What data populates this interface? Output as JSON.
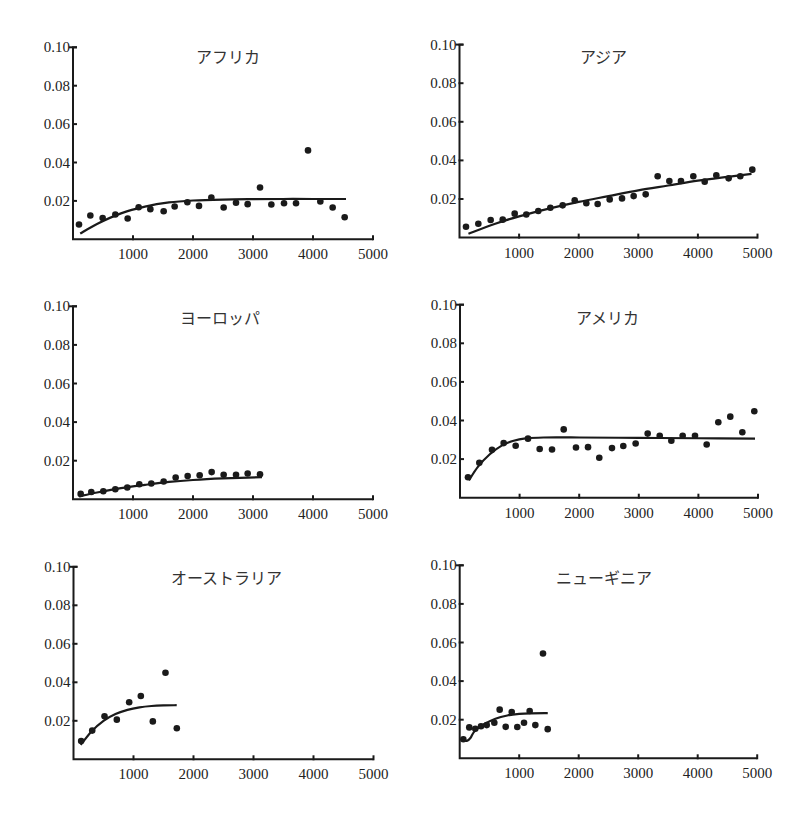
{
  "chart_data": [
    {
      "type": "scatter",
      "title": "アフリカ",
      "xlabel": "",
      "ylabel": "",
      "xlim": [
        0,
        5000
      ],
      "ylim": [
        0,
        0.1
      ],
      "xticks": [
        "1000",
        "2000",
        "3000",
        "4000",
        "5000"
      ],
      "yticks": [
        "0.02",
        "0.04",
        "0.06",
        "0.08",
        "0.10"
      ],
      "grid": false,
      "points": [
        [
          100,
          0.0077
        ],
        [
          289,
          0.0124
        ],
        [
          494,
          0.0111
        ],
        [
          706,
          0.0129
        ],
        [
          911,
          0.0108
        ],
        [
          1094,
          0.0167
        ],
        [
          1289,
          0.0157
        ],
        [
          1511,
          0.0146
        ],
        [
          1694,
          0.0171
        ],
        [
          1906,
          0.0193
        ],
        [
          2100,
          0.0174
        ],
        [
          2306,
          0.0218
        ],
        [
          2511,
          0.0166
        ],
        [
          2717,
          0.019
        ],
        [
          2911,
          0.0183
        ],
        [
          3117,
          0.027
        ],
        [
          3306,
          0.0181
        ],
        [
          3517,
          0.0188
        ],
        [
          3717,
          0.0188
        ],
        [
          3917,
          0.0463
        ],
        [
          4122,
          0.0197
        ],
        [
          4328,
          0.0166
        ],
        [
          4528,
          0.0115
        ]
      ],
      "fit": [
        [
          120,
          0.003
        ],
        [
          400,
          0.008
        ],
        [
          800,
          0.0135
        ],
        [
          1200,
          0.017
        ],
        [
          1600,
          0.0192
        ],
        [
          2000,
          0.0202
        ],
        [
          2500,
          0.0207
        ],
        [
          3000,
          0.0209
        ],
        [
          3500,
          0.021
        ],
        [
          4000,
          0.021
        ],
        [
          4550,
          0.021
        ]
      ]
    },
    {
      "type": "scatter",
      "title": "アジア",
      "xlabel": "",
      "ylabel": "",
      "xlim": [
        0,
        5000
      ],
      "ylim": [
        0,
        0.1
      ],
      "xticks": [
        "1000",
        "2000",
        "3000",
        "4000",
        "5000"
      ],
      "yticks": [
        "0.02",
        "0.04",
        "0.06",
        "0.08",
        "0.10"
      ],
      "grid": false,
      "points": [
        [
          109,
          0.0056
        ],
        [
          316,
          0.0072
        ],
        [
          523,
          0.0091
        ],
        [
          725,
          0.0093
        ],
        [
          926,
          0.0124
        ],
        [
          1121,
          0.012
        ],
        [
          1322,
          0.0138
        ],
        [
          1524,
          0.0155
        ],
        [
          1731,
          0.0167
        ],
        [
          1933,
          0.0193
        ],
        [
          2128,
          0.0178
        ],
        [
          2318,
          0.0174
        ],
        [
          2520,
          0.0198
        ],
        [
          2727,
          0.0203
        ],
        [
          2922,
          0.0215
        ],
        [
          3124,
          0.0224
        ],
        [
          3325,
          0.0318
        ],
        [
          3521,
          0.0293
        ],
        [
          3716,
          0.0293
        ],
        [
          3923,
          0.0318
        ],
        [
          4114,
          0.029
        ],
        [
          4309,
          0.0323
        ],
        [
          4516,
          0.0307
        ],
        [
          4711,
          0.0318
        ],
        [
          4913,
          0.0352
        ]
      ],
      "fit": [
        [
          150,
          0.002
        ],
        [
          600,
          0.0072
        ],
        [
          1000,
          0.011
        ],
        [
          1500,
          0.015
        ],
        [
          2000,
          0.0185
        ],
        [
          2500,
          0.0215
        ],
        [
          3000,
          0.0245
        ],
        [
          3500,
          0.027
        ],
        [
          4000,
          0.0295
        ],
        [
          4500,
          0.0315
        ],
        [
          4900,
          0.033
        ]
      ]
    },
    {
      "type": "scatter",
      "title": "ヨーロッパ",
      "xlabel": "",
      "ylabel": "",
      "xlim": [
        0,
        5000
      ],
      "ylim": [
        0,
        0.1
      ],
      "xticks": [
        "1000",
        "2000",
        "3000",
        "4000",
        "5000"
      ],
      "yticks": [
        "0.02",
        "0.04",
        "0.06",
        "0.08",
        "0.10"
      ],
      "grid": false,
      "points": [
        [
          128,
          0.0028
        ],
        [
          305,
          0.0038
        ],
        [
          505,
          0.0042
        ],
        [
          705,
          0.0052
        ],
        [
          905,
          0.0061
        ],
        [
          1105,
          0.0078
        ],
        [
          1305,
          0.0082
        ],
        [
          1511,
          0.0092
        ],
        [
          1711,
          0.0113
        ],
        [
          1911,
          0.0121
        ],
        [
          2111,
          0.0125
        ],
        [
          2311,
          0.0141
        ],
        [
          2511,
          0.0127
        ],
        [
          2717,
          0.0127
        ],
        [
          2911,
          0.0134
        ],
        [
          3117,
          0.013
        ]
      ],
      "fit": [
        [
          100,
          0.0015
        ],
        [
          400,
          0.0035
        ],
        [
          800,
          0.0058
        ],
        [
          1200,
          0.0075
        ],
        [
          1600,
          0.009
        ],
        [
          2000,
          0.01
        ],
        [
          2500,
          0.0108
        ],
        [
          3150,
          0.0115
        ]
      ]
    },
    {
      "type": "scatter",
      "title": "アメリカ",
      "xlabel": "",
      "ylabel": "",
      "xlim": [
        0,
        5000
      ],
      "ylim": [
        0,
        0.1
      ],
      "xticks": [
        "1000",
        "2000",
        "3000",
        "4000",
        "5000"
      ],
      "yticks": [
        "0.02",
        "0.04",
        "0.06",
        "0.08",
        "0.10"
      ],
      "grid": false,
      "points": [
        [
          134,
          0.0106
        ],
        [
          324,
          0.0181
        ],
        [
          537,
          0.0248
        ],
        [
          733,
          0.0283
        ],
        [
          934,
          0.0269
        ],
        [
          1141,
          0.0306
        ],
        [
          1337,
          0.0252
        ],
        [
          1544,
          0.025
        ],
        [
          1740,
          0.0354
        ],
        [
          1946,
          0.026
        ],
        [
          2148,
          0.0262
        ],
        [
          2337,
          0.0207
        ],
        [
          2550,
          0.0257
        ],
        [
          2740,
          0.0268
        ],
        [
          2947,
          0.0281
        ],
        [
          3149,
          0.0332
        ],
        [
          3351,
          0.0321
        ],
        [
          3546,
          0.0295
        ],
        [
          3736,
          0.0321
        ],
        [
          3943,
          0.0321
        ],
        [
          4139,
          0.0276
        ],
        [
          4334,
          0.0391
        ],
        [
          4535,
          0.042
        ],
        [
          4737,
          0.0339
        ],
        [
          4938,
          0.0448
        ]
      ],
      "fit": [
        [
          150,
          0.009
        ],
        [
          300,
          0.016
        ],
        [
          500,
          0.0225
        ],
        [
          700,
          0.027
        ],
        [
          900,
          0.0295
        ],
        [
          1100,
          0.0307
        ],
        [
          1400,
          0.0312
        ],
        [
          2000,
          0.0312
        ],
        [
          3000,
          0.031
        ],
        [
          4000,
          0.0308
        ],
        [
          4950,
          0.0306
        ]
      ]
    },
    {
      "type": "scatter",
      "title": "オーストラリア",
      "xlabel": "",
      "ylabel": "",
      "xlim": [
        0,
        5000
      ],
      "ylim": [
        0,
        0.1
      ],
      "xticks": [
        "1000",
        "2000",
        "3000",
        "4000",
        "5000"
      ],
      "yticks": [
        "0.02",
        "0.04",
        "0.06",
        "0.08",
        "0.10"
      ],
      "grid": false,
      "points": [
        [
          128,
          0.0095
        ],
        [
          312,
          0.0149
        ],
        [
          517,
          0.0223
        ],
        [
          722,
          0.0206
        ],
        [
          928,
          0.0296
        ],
        [
          1122,
          0.0329
        ],
        [
          1322,
          0.0197
        ],
        [
          1533,
          0.045
        ],
        [
          1722,
          0.0161
        ]
      ],
      "fit": [
        [
          120,
          0.0075
        ],
        [
          300,
          0.0145
        ],
        [
          500,
          0.02
        ],
        [
          700,
          0.0235
        ],
        [
          900,
          0.0257
        ],
        [
          1100,
          0.027
        ],
        [
          1300,
          0.0277
        ],
        [
          1500,
          0.028
        ],
        [
          1720,
          0.0281
        ]
      ]
    },
    {
      "type": "scatter",
      "title": "ニューギニア",
      "xlabel": "",
      "ylabel": "",
      "xlim": [
        0,
        5000
      ],
      "ylim": [
        0,
        0.1
      ],
      "xticks": [
        "1000",
        "2000",
        "3000",
        "4000",
        "5000"
      ],
      "yticks": [
        "0.02",
        "0.04",
        "0.06",
        "0.08",
        "0.10"
      ],
      "grid": false,
      "points": [
        [
          61,
          0.0099
        ],
        [
          161,
          0.016
        ],
        [
          262,
          0.0153
        ],
        [
          358,
          0.0166
        ],
        [
          454,
          0.0172
        ],
        [
          582,
          0.0184
        ],
        [
          672,
          0.0252
        ],
        [
          773,
          0.0163
        ],
        [
          874,
          0.024
        ],
        [
          968,
          0.0162
        ],
        [
          1081,
          0.0184
        ],
        [
          1176,
          0.0245
        ],
        [
          1271,
          0.0172
        ],
        [
          1400,
          0.0543
        ],
        [
          1479,
          0.0151
        ]
      ],
      "fit": [
        [
          60,
          0.0095
        ],
        [
          120,
          0.009
        ],
        [
          180,
          0.0105
        ],
        [
          250,
          0.014
        ],
        [
          400,
          0.0175
        ],
        [
          600,
          0.0205
        ],
        [
          800,
          0.0222
        ],
        [
          1000,
          0.023
        ],
        [
          1200,
          0.0233
        ],
        [
          1480,
          0.0234
        ]
      ]
    }
  ],
  "panels_layout": [
    {
      "ox": 73,
      "oy": 239.3,
      "xs": 0.06,
      "ys": 1920,
      "title_x": 228,
      "title_y": 63
    },
    {
      "ox": 459.5,
      "oy": 237.6,
      "xs": 0.0596,
      "ys": 1930,
      "title_x": 603,
      "title_y": 63
    },
    {
      "ox": 73,
      "oy": 499.3,
      "xs": 0.06,
      "ys": 1930,
      "title_x": 220,
      "title_y": 324
    },
    {
      "ox": 460,
      "oy": 497.7,
      "xs": 0.0596,
      "ys": 1930,
      "title_x": 607,
      "title_y": 324
    },
    {
      "ox": 73.5,
      "oy": 759.3,
      "xs": 0.06,
      "ys": 1925,
      "title_x": 226,
      "title_y": 584
    },
    {
      "ox": 459.7,
      "oy": 758.3,
      "xs": 0.0595,
      "ys": 1930,
      "title_x": 604,
      "title_y": 584
    }
  ]
}
